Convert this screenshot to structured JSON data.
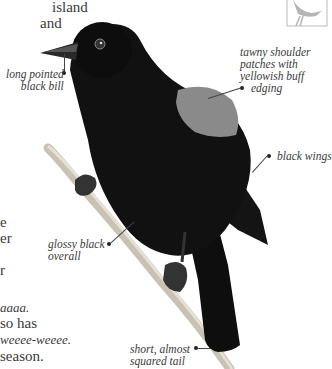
{
  "body_text": {
    "lines": [
      {
        "text": "island",
        "italic": false
      },
      {
        "text": "and",
        "italic": false
      },
      {
        "text": "e",
        "italic": false
      },
      {
        "text": "er",
        "italic": false
      },
      {
        "text": "r",
        "italic": false
      },
      {
        "text": "aaaa.",
        "italic": true
      },
      {
        "text": "so has",
        "italic": false
      },
      {
        "text": "weeee-weeee.",
        "italic": true
      },
      {
        "text": "season.",
        "italic": false
      }
    ]
  },
  "annotations": {
    "bill": "long pointed\nblack bill",
    "bill_l1": "long pointed",
    "bill_l2": "black bill",
    "shoulder_l1": "tawny shoulder",
    "shoulder_l2": "patches with",
    "shoulder_l3": "yellowish buff",
    "shoulder_l4": "edging",
    "wings": "black wings",
    "glossy_l1": "glossy black",
    "glossy_l2": "overall",
    "tail_l1": "short, almost",
    "tail_l2": "squared tail"
  },
  "colors": {
    "bird_body": "#111111",
    "shoulder_patch": "#8a8a8a",
    "branch": "#c9c2b4",
    "thumbnail_silhouette": "#b5b5b5"
  }
}
